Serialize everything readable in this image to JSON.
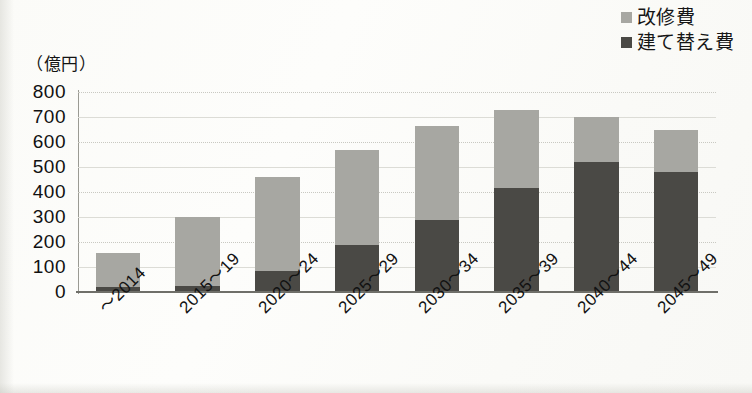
{
  "legend": {
    "position": "top-right",
    "items": [
      {
        "label": "改修費",
        "color": "#a7a7a2",
        "swatch_name": "legend-swatch-renovation"
      },
      {
        "label": "建て替え費",
        "color": "#4a4945",
        "swatch_name": "legend-swatch-rebuild"
      }
    ]
  },
  "axis": {
    "unit_label": "（億円）",
    "y_ticks": [
      "800",
      "700",
      "600",
      "500",
      "400",
      "300",
      "200",
      "100",
      "0"
    ]
  },
  "chart_data": {
    "type": "bar",
    "stacked": true,
    "title": "",
    "subtitle": "",
    "xlabel": "",
    "ylabel": "（億円）",
    "ylim": [
      0,
      800
    ],
    "ytick_step": 100,
    "grid": true,
    "legend_position": "top-right",
    "categories": [
      "〜2014",
      "2015〜19",
      "2020〜24",
      "2025〜29",
      "2030〜34",
      "2035〜39",
      "2040〜44",
      "2045〜49"
    ],
    "series": [
      {
        "name": "建て替え費",
        "color": "#4a4945",
        "values": [
          20,
          25,
          85,
          190,
          290,
          415,
          520,
          480
        ]
      },
      {
        "name": "改修費",
        "color": "#a7a7a2",
        "values": [
          135,
          275,
          375,
          380,
          375,
          315,
          180,
          170
        ]
      }
    ],
    "totals": [
      155,
      300,
      460,
      570,
      665,
      730,
      700,
      650
    ]
  }
}
